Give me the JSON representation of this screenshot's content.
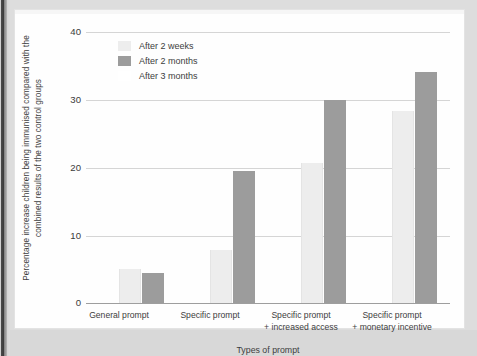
{
  "chart_data": {
    "type": "bar",
    "title": "",
    "subtitle": "",
    "xlabel": "Types of prompt",
    "ylabel": "Percentage increase children being immunised compared with the combined results of the two control groups",
    "categories": [
      "General prompt",
      "Specific prompt",
      "Specific prompt\n+ increased access",
      "Specific prompt\n+ monetary incentive"
    ],
    "category_lines": [
      [
        "General prompt",
        ""
      ],
      [
        "Specific prompt",
        ""
      ],
      [
        "Specific prompt",
        "+ increased access"
      ],
      [
        "Specific prompt",
        "+ monetary incentive"
      ]
    ],
    "series": [
      {
        "name": "After 2 weeks",
        "color": "#ededed",
        "values": [
          5.0,
          7.8,
          20.6,
          28.3
        ]
      },
      {
        "name": "After 2 months",
        "color": "#9c9c9c",
        "values": [
          4.4,
          19.5,
          30.0,
          34.1
        ]
      },
      {
        "name": "After 3 months",
        "color": "#ffffff",
        "values": [
          null,
          null,
          null,
          null
        ]
      }
    ],
    "ylim": [
      0,
      40
    ],
    "yticks": [
      0,
      10,
      20,
      30,
      40
    ],
    "ytick_labels": [
      "0",
      "10",
      "20",
      "30",
      "40"
    ],
    "grid": "horizontal",
    "legend_position": "upper-left-inside"
  },
  "axis": {
    "ytick_labels": [
      "40",
      "30",
      "20",
      "10",
      "0"
    ],
    "xlabel": "Types of prompt",
    "ylabel_line1": "Percentage increase children being immunised compared with the",
    "ylabel_line2": "combined results of the two control groups"
  },
  "legend": {
    "items": [
      {
        "label": "After 2 weeks",
        "swatch": "#ededed",
        "swatch_visible": true
      },
      {
        "label": "After 2 months",
        "swatch": "#9c9c9c",
        "swatch_visible": true
      },
      {
        "label": "After 3 months",
        "swatch": "#ffffff",
        "swatch_visible": false
      }
    ]
  },
  "colors": {
    "bar_light": "#ededed",
    "bar_dark": "#9c9c9c",
    "gridline": "#d5d5d5",
    "axis": "#9e9e9e",
    "text": "#3d3d3d",
    "panel": "#fefefe",
    "page_margin": "#d8d8d8"
  }
}
